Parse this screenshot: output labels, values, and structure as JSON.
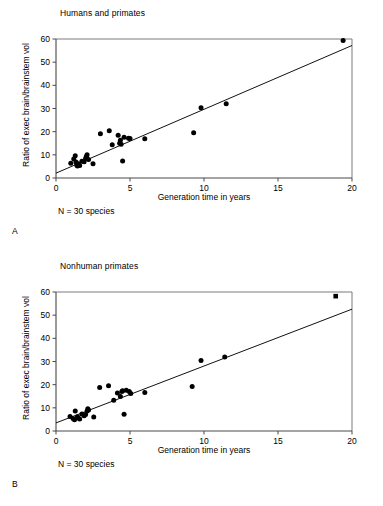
{
  "figure": {
    "panels": [
      {
        "letter": "A",
        "title": "Humans and primates",
        "note": "N = 30 species",
        "marker_shape": "circle"
      },
      {
        "letter": "B",
        "title": "Nonhuman primates",
        "note": "N = 30 species",
        "marker_shape": "circle"
      }
    ]
  },
  "chart_data": [
    {
      "type": "scatter",
      "panel": "A",
      "title": "Humans and primates",
      "xlabel": "Generation time in years",
      "ylabel": "Ratio of exec brain/brainstem vol",
      "annotation": "N = 30 species",
      "xlim": [
        0,
        20
      ],
      "ylim": [
        0,
        60
      ],
      "xticks": [
        0,
        5,
        10,
        15,
        20
      ],
      "yticks": [
        0,
        10,
        20,
        30,
        40,
        50,
        60
      ],
      "xtick_labels": [
        "0",
        "5",
        "10",
        "15",
        "20"
      ],
      "ytick_labels": [
        "0",
        "10",
        "20",
        "30",
        "40",
        "50",
        "60"
      ],
      "grid": false,
      "legend": "none",
      "marker": "circle",
      "points": [
        {
          "x": 1.0,
          "y": 6.4
        },
        {
          "x": 1.2,
          "y": 8.2
        },
        {
          "x": 1.3,
          "y": 9.6
        },
        {
          "x": 1.35,
          "y": 6.9
        },
        {
          "x": 1.4,
          "y": 5.6
        },
        {
          "x": 1.45,
          "y": 5.2
        },
        {
          "x": 1.5,
          "y": 6.1
        },
        {
          "x": 1.6,
          "y": 5.4
        },
        {
          "x": 1.75,
          "y": 7.2
        },
        {
          "x": 1.9,
          "y": 7.0
        },
        {
          "x": 2.0,
          "y": 8.4
        },
        {
          "x": 2.05,
          "y": 9.3
        },
        {
          "x": 2.1,
          "y": 10.0
        },
        {
          "x": 2.2,
          "y": 8.0
        },
        {
          "x": 2.5,
          "y": 6.2
        },
        {
          "x": 3.0,
          "y": 19.1
        },
        {
          "x": 3.6,
          "y": 20.4
        },
        {
          "x": 3.8,
          "y": 14.4
        },
        {
          "x": 4.2,
          "y": 18.5
        },
        {
          "x": 4.3,
          "y": 15.0
        },
        {
          "x": 4.35,
          "y": 16.3
        },
        {
          "x": 4.4,
          "y": 14.6
        },
        {
          "x": 4.5,
          "y": 7.3
        },
        {
          "x": 4.6,
          "y": 17.6
        },
        {
          "x": 4.9,
          "y": 17.2
        },
        {
          "x": 5.0,
          "y": 17.0
        },
        {
          "x": 6.0,
          "y": 16.9
        },
        {
          "x": 9.3,
          "y": 19.5
        },
        {
          "x": 9.8,
          "y": 30.3
        },
        {
          "x": 11.5,
          "y": 32.1
        },
        {
          "x": 19.4,
          "y": 59.3
        }
      ],
      "fit_line": {
        "x0": 0,
        "y0": 2.1,
        "x1": 20,
        "y1": 57.2
      }
    },
    {
      "type": "scatter",
      "panel": "B",
      "title": "Nonhuman primates",
      "xlabel": "Generation time in years",
      "ylabel": "Ratio of exec brain/brainstem vol",
      "annotation": "N = 30 species",
      "xlim": [
        0,
        20
      ],
      "ylim": [
        0,
        60
      ],
      "xticks": [
        0,
        5,
        10,
        15,
        20
      ],
      "yticks": [
        0,
        10,
        20,
        30,
        40,
        50,
        60
      ],
      "xtick_labels": [
        "0",
        "5",
        "10",
        "15",
        "20"
      ],
      "ytick_labels": [
        "0",
        "10",
        "20",
        "30",
        "40",
        "50",
        "60"
      ],
      "grid": false,
      "legend": "none",
      "marker": "circle",
      "points": [
        {
          "x": 0.95,
          "y": 6.3
        },
        {
          "x": 1.15,
          "y": 5.4
        },
        {
          "x": 1.25,
          "y": 4.9
        },
        {
          "x": 1.3,
          "y": 8.6
        },
        {
          "x": 1.45,
          "y": 6.2
        },
        {
          "x": 1.5,
          "y": 5.6
        },
        {
          "x": 1.6,
          "y": 5.2
        },
        {
          "x": 1.75,
          "y": 7.3
        },
        {
          "x": 1.9,
          "y": 6.6
        },
        {
          "x": 2.0,
          "y": 7.1
        },
        {
          "x": 2.1,
          "y": 8.6
        },
        {
          "x": 2.15,
          "y": 9.6
        },
        {
          "x": 2.2,
          "y": 9.1
        },
        {
          "x": 2.55,
          "y": 6.0
        },
        {
          "x": 2.95,
          "y": 18.8
        },
        {
          "x": 3.55,
          "y": 19.5
        },
        {
          "x": 3.9,
          "y": 13.3
        },
        {
          "x": 4.15,
          "y": 16.4
        },
        {
          "x": 4.35,
          "y": 14.9
        },
        {
          "x": 4.45,
          "y": 17.0
        },
        {
          "x": 4.5,
          "y": 17.4
        },
        {
          "x": 4.6,
          "y": 7.2
        },
        {
          "x": 4.75,
          "y": 17.6
        },
        {
          "x": 4.95,
          "y": 17.1
        },
        {
          "x": 5.05,
          "y": 16.2
        },
        {
          "x": 6.0,
          "y": 16.6
        },
        {
          "x": 9.2,
          "y": 19.2
        },
        {
          "x": 9.8,
          "y": 30.4
        },
        {
          "x": 11.4,
          "y": 31.9
        }
      ],
      "special_points": [
        {
          "x": 18.9,
          "y": 58.2,
          "marker": "square"
        }
      ],
      "fit_line": {
        "x0": 0,
        "y0": 3.5,
        "x1": 20,
        "y1": 52.6
      }
    }
  ]
}
